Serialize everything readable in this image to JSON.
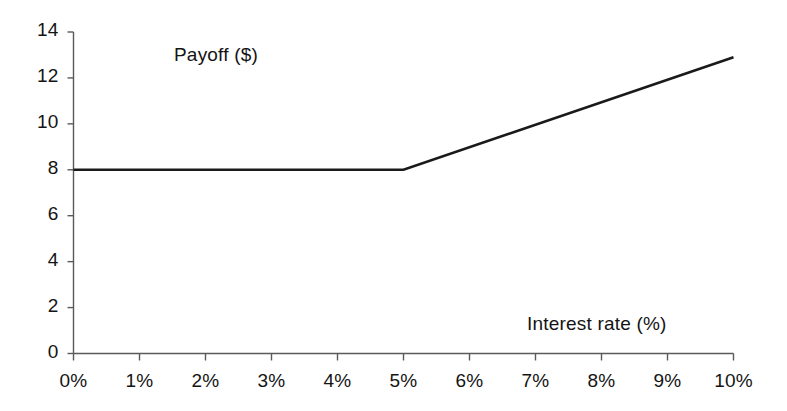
{
  "chart_data": {
    "type": "line",
    "title": "",
    "subtitle": "",
    "xlabel": "Interest rate (%)",
    "ylabel": "Payoff ($)",
    "ylabel_position": "inside-plot-top-left",
    "xlabel_position": "inside-plot-bottom-right",
    "grid": false,
    "legend": null,
    "legend_position": "none",
    "xlim": [
      0,
      10
    ],
    "ylim": [
      0,
      14
    ],
    "x_tick_labels": [
      "0%",
      "1%",
      "2%",
      "3%",
      "4%",
      "5%",
      "6%",
      "7%",
      "8%",
      "9%",
      "10%"
    ],
    "x_tick_values": [
      0,
      1,
      2,
      3,
      4,
      5,
      6,
      7,
      8,
      9,
      10
    ],
    "y_tick_labels": [
      "0",
      "2",
      "4",
      "6",
      "8",
      "10",
      "12",
      "14"
    ],
    "y_tick_values": [
      0,
      2,
      4,
      6,
      8,
      10,
      12,
      14
    ],
    "series": [
      {
        "name": "Payoff",
        "color": "#1a1a1a",
        "line_width": 2.6,
        "x": [
          0,
          1,
          2,
          3,
          4,
          5,
          6,
          7,
          8,
          9,
          10
        ],
        "values": [
          8,
          8,
          8,
          8,
          8,
          8,
          8.98,
          9.96,
          10.94,
          11.92,
          12.9
        ]
      }
    ],
    "breakpoints": [
      {
        "x": 0,
        "y": 8
      },
      {
        "x": 5,
        "y": 8
      },
      {
        "x": 10,
        "y": 12.9
      }
    ],
    "annotations": []
  },
  "axes": {
    "axis_color": "#5a5a5a",
    "tick_color": "#5a5a5a",
    "background_color": "#ffffff"
  }
}
